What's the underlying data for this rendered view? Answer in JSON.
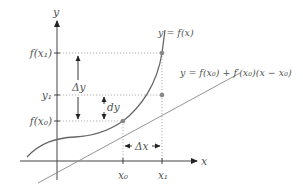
{
  "diagram": {
    "axes": {
      "x_label": "x",
      "y_label": "y"
    },
    "y_ticks": [
      {
        "label": "f(x₁)",
        "y": 53
      },
      {
        "label": "y₁",
        "y": 95
      },
      {
        "label": "f(x₀)",
        "y": 121
      }
    ],
    "x_ticks": [
      {
        "label": "x₀",
        "x": 123
      },
      {
        "label": "x₁",
        "x": 162
      }
    ],
    "curve_label": "y = f(x)",
    "tangent_label": "y = f(x₀) + f′(x₀)(x − x₀)",
    "annotations": {
      "delta_y": "Δy",
      "dy": "dy",
      "delta_x": "Δx"
    },
    "colors": {
      "axis": "#333333",
      "curve": "#555555",
      "tangent": "#777777",
      "point": "#888888",
      "guide": "#999999",
      "text": "#555555"
    }
  }
}
